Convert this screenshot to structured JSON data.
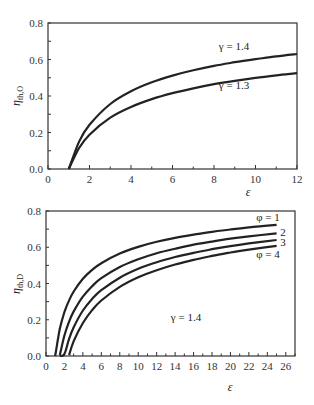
{
  "chart_data": [
    {
      "type": "line",
      "title": "",
      "xlabel": "ε",
      "ylabel": "η_th,O",
      "xlim": [
        0,
        12
      ],
      "ylim": [
        0,
        0.8
      ],
      "xticks": [
        0,
        2,
        4,
        6,
        8,
        10,
        12
      ],
      "yticks": [
        0.0,
        0.2,
        0.4,
        0.6,
        0.8
      ],
      "ytick_labels": [
        "0.0",
        "0.2",
        "0.4",
        "0.6",
        "0.8"
      ],
      "grid": false,
      "legend": "inline labels",
      "x": [
        1,
        1.5,
        2,
        3,
        4,
        5,
        6,
        7,
        8,
        9,
        10,
        11,
        12
      ],
      "series": [
        {
          "name": "γ = 1.4",
          "values": [
            0.0,
            0.15,
            0.242,
            0.356,
            0.426,
            0.475,
            0.512,
            0.541,
            0.565,
            0.585,
            0.602,
            0.617,
            0.63
          ]
        },
        {
          "name": "γ = 1.3",
          "values": [
            0.0,
            0.115,
            0.188,
            0.281,
            0.34,
            0.383,
            0.416,
            0.442,
            0.465,
            0.483,
            0.499,
            0.513,
            0.525
          ]
        }
      ],
      "annotations": [
        "γ = 1.4",
        "γ = 1.3"
      ]
    },
    {
      "type": "line",
      "title": "",
      "xlabel": "ε",
      "ylabel": "η_th,D",
      "xlim": [
        0,
        27
      ],
      "ylim": [
        0,
        0.8
      ],
      "xticks": [
        0,
        2,
        4,
        6,
        8,
        10,
        12,
        14,
        16,
        18,
        20,
        22,
        24,
        26
      ],
      "yticks": [
        0.0,
        0.2,
        0.4,
        0.6,
        0.8
      ],
      "ytick_labels": [
        "0.0",
        "0.2",
        "0.4",
        "0.6",
        "0.8"
      ],
      "grid": false,
      "legend": "inline labels",
      "x": [
        1,
        1.5,
        2,
        2.5,
        3,
        4,
        5,
        6,
        8,
        10,
        12,
        14,
        16,
        18,
        20,
        22,
        25
      ],
      "series": [
        {
          "name": "φ = 1",
          "values": [
            0.0,
            0.15,
            0.242,
            0.307,
            0.356,
            0.426,
            0.475,
            0.512,
            0.565,
            0.602,
            0.63,
            0.652,
            0.67,
            0.685,
            0.698,
            0.71,
            0.724
          ]
        },
        {
          "name": "φ = 2",
          "values": [
            0.0,
            0.005,
            0.113,
            0.189,
            0.246,
            0.328,
            0.385,
            0.429,
            0.491,
            0.534,
            0.567,
            0.592,
            0.614,
            0.631,
            0.647,
            0.66,
            0.677
          ]
        },
        {
          "name": "φ = 3",
          "values": [
            0.0,
            0.0,
            0.011,
            0.095,
            0.159,
            0.251,
            0.315,
            0.363,
            0.432,
            0.481,
            0.517,
            0.546,
            0.569,
            0.589,
            0.606,
            0.621,
            0.64
          ]
        },
        {
          "name": "φ = 4",
          "values": [
            0.0,
            0.0,
            0.0,
            0.005,
            0.082,
            0.182,
            0.253,
            0.306,
            0.381,
            0.434,
            0.473,
            0.505,
            0.53,
            0.552,
            0.571,
            0.587,
            0.608
          ]
        }
      ],
      "annotations": [
        "φ = 1",
        "2",
        "3",
        "φ = 4",
        "γ = 1.4"
      ]
    }
  ]
}
